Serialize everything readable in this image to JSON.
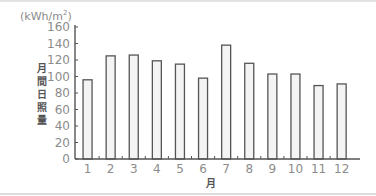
{
  "chart_data": {
    "type": "bar",
    "title": "",
    "unit": "(kWh/m²)",
    "xlabel": "月",
    "ylabel": "月間日照量",
    "categories": [
      "1",
      "2",
      "3",
      "4",
      "5",
      "6",
      "7",
      "8",
      "9",
      "10",
      "11",
      "12"
    ],
    "values": [
      96,
      125,
      126,
      119,
      115,
      98,
      138,
      116,
      103,
      103,
      89,
      91
    ],
    "yticks": [
      0,
      20,
      40,
      60,
      80,
      100,
      120,
      140,
      160
    ],
    "ylim": [
      0,
      160
    ],
    "grid": false,
    "legend": null,
    "colors": {
      "bar_fill": "#f4f4f4",
      "bar_stroke": "#555555",
      "axis": "#555555",
      "tick_text": "#8c8c8c"
    }
  },
  "labels": {
    "unit_prefix": "(kWh/m",
    "unit_sup": "2",
    "unit_suffix": ")",
    "ylabel_chars": [
      "月",
      "間",
      "日",
      "照",
      "量"
    ],
    "xlabel": "月"
  }
}
